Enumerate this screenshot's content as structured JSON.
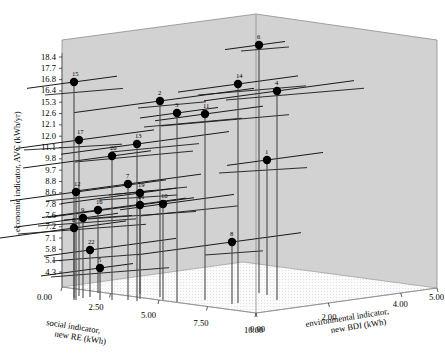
{
  "chart_data": {
    "type": "scatter",
    "title": "",
    "projection": "3d",
    "xlabel": "social indicator, new RE (kWh)",
    "ylabel": "economic indicator, AVC (kWh/yr)",
    "zlabel": "environmental indicator, new BDI (kWh)",
    "xlabel_line1": "social indicator,",
    "xlabel_line2": "new RE (kWh)",
    "zlabel_line1": "environmental indicator,",
    "zlabel_line2": "new BDI (kWh)",
    "xticks": [
      "0.00",
      "2.50",
      "5.00",
      "7.50",
      "10.00"
    ],
    "xtick_values": [
      0,
      2.5,
      5,
      7.5,
      10
    ],
    "zticks": [
      "0.00",
      "2.00",
      "4.00",
      "5.00"
    ],
    "ztick_values": [
      0,
      2,
      4,
      5
    ],
    "yticks": [
      "18.4",
      "17.7",
      "16.8",
      "16.4",
      "15.3",
      "12.6",
      "12.1",
      "12.0",
      "11.1",
      "9.8",
      "9.7",
      "8.8",
      "8.6",
      "7.8",
      "7.6",
      "7.2",
      "7.1",
      "5.8",
      "5.1",
      "4.3"
    ],
    "ytick_values": [
      18.4,
      17.7,
      16.8,
      16.4,
      15.3,
      12.6,
      12.1,
      12.0,
      11.1,
      9.8,
      9.7,
      8.8,
      8.6,
      7.8,
      7.6,
      7.2,
      7.1,
      5.8,
      5.1,
      4.3
    ],
    "grid": false,
    "legend": "none",
    "marker": "filled-circle",
    "marker_color": "#000000",
    "wall_color": "#d2d2d2",
    "floor_color": "#f0f0f0",
    "points": [
      {
        "label": "6",
        "px": 259,
        "py": 45,
        "avc": 18.4,
        "re": 6.4,
        "bdi": 1.45
      },
      {
        "label": "15",
        "px": 74,
        "py": 82,
        "avc": 16.8,
        "re": 0.2,
        "bdi": 0.3
      },
      {
        "label": "14",
        "px": 238,
        "py": 84,
        "avc": 16.8,
        "re": 6.05,
        "bdi": 0.75
      },
      {
        "label": "4",
        "px": 277,
        "py": 91,
        "avc": 16.4,
        "re": 6.95,
        "bdi": 1.65
      },
      {
        "label": "2",
        "px": 160,
        "py": 101,
        "avc": 15.3,
        "re": 3.2,
        "bdi": 0.65
      },
      {
        "label": "3",
        "px": 177,
        "py": 113,
        "avc": 12.6,
        "re": 3.75,
        "bdi": 0.75
      },
      {
        "label": "11",
        "px": 205,
        "py": 114,
        "avc": 12.6,
        "re": 4.55,
        "bdi": 1.05
      },
      {
        "label": "17",
        "px": 79,
        "py": 140,
        "avc": 11.1,
        "re": 0.25,
        "bdi": 0.4
      },
      {
        "label": "13",
        "px": 137,
        "py": 144,
        "avc": 11.1,
        "re": 2.35,
        "bdi": 0.55
      },
      {
        "label": "20",
        "px": 112,
        "py": 156,
        "avc": 9.8,
        "re": 1.6,
        "bdi": 0.45
      },
      {
        "label": "1",
        "px": 267,
        "py": 160,
        "avc": 9.8,
        "re": 6.4,
        "bdi": 1.8
      },
      {
        "label": "7",
        "px": 128,
        "py": 184,
        "avc": 8.6,
        "re": 2.1,
        "bdi": 0.55
      },
      {
        "label": "12",
        "px": 76,
        "py": 192,
        "avc": 8.6,
        "re": 0.2,
        "bdi": 0.35
      },
      {
        "label": "19",
        "px": 140,
        "py": 193,
        "avc": 8.6,
        "re": 2.5,
        "bdi": 0.6
      },
      {
        "label": "21",
        "px": 140,
        "py": 205,
        "avc": 7.8,
        "re": 2.5,
        "bdi": 0.6
      },
      {
        "label": "10",
        "px": 163,
        "py": 204,
        "avc": 7.8,
        "re": 3.2,
        "bdi": 0.7
      },
      {
        "label": "16",
        "px": 98,
        "py": 210,
        "avc": 7.6,
        "re": 1.15,
        "bdi": 0.4
      },
      {
        "label": "9",
        "px": 83,
        "py": 218,
        "avc": 7.2,
        "re": 0.55,
        "bdi": 0.35
      },
      {
        "label": "8",
        "px": 74,
        "py": 228,
        "avc": 7.1,
        "re": 0.15,
        "bdi": 0.25
      },
      {
        "label": "8",
        "px": 232,
        "py": 242,
        "avc": 5.8,
        "re": 5.6,
        "bdi": 0.9
      },
      {
        "label": "22",
        "px": 90,
        "py": 250,
        "avc": 5.1,
        "re": 0.8,
        "bdi": 0.35
      },
      {
        "label": "5",
        "px": 100,
        "py": 268,
        "avc": 4.3,
        "re": 1.2,
        "bdi": 0.4
      }
    ]
  }
}
